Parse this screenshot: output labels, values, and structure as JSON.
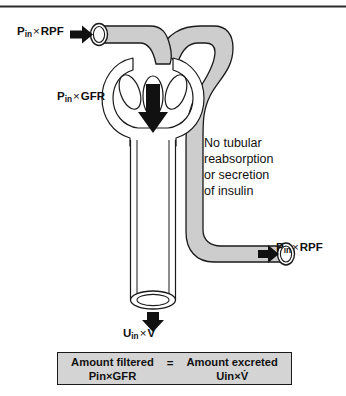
{
  "figure": {
    "top_rule": true
  },
  "labels": {
    "afferent_flow": {
      "p": "P",
      "sub": "in",
      "times": "×",
      "term": "RPF",
      "arrow": "right-arrow"
    },
    "filtration": {
      "p": "P",
      "sub": "in",
      "times": "×",
      "term": "GFR",
      "arrow": "down-arrow"
    },
    "efferent_flow": {
      "p": "P",
      "sub": "in",
      "times": "×",
      "term": "RPF",
      "arrow": "right-arrow"
    },
    "excretion": {
      "u": "U",
      "sub": "in",
      "times": "×",
      "term": "V̇",
      "arrow": "down-arrow"
    },
    "annotation_lines": [
      "No tubular",
      "reabsorption",
      "or secretion",
      "of insulin"
    ]
  },
  "balance_box": {
    "left": {
      "line1": "Amount filtered",
      "line2_symbol": "P",
      "line2_sub": "in",
      "line2_times": "×",
      "line2_term": "GFR"
    },
    "equals": "=",
    "right": {
      "line1": "Amount excreted",
      "line2_symbol": "U",
      "line2_sub": "in",
      "line2_times": "×",
      "line2_term": "V̇"
    }
  },
  "colors": {
    "vessel_fill": "#cdcdcd",
    "tubule_fill": "#ffffff",
    "outline": "#1a1a1a",
    "box_fill": "#d4d4d4",
    "arrow": "#111111",
    "rule": "#2b2b2b"
  },
  "anatomy": {
    "afferent_arteriole": "afferent-arteriole",
    "glomerulus": "glomerular-capillary-tuft",
    "bowmans_capsule": "bowmans-capsule",
    "proximal_tubule": "renal-tubule",
    "efferent_arteriole": "efferent-arteriole",
    "capillary_loop_count": 3
  }
}
